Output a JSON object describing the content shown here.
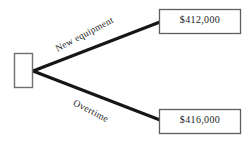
{
  "diagram": {
    "type": "decision-tree",
    "background_color": "#ffffff",
    "line_color": "#161616",
    "box_border_color": "#5d5d5d",
    "text_color": "#1d1d1d",
    "decision_node": {
      "shape": "rectangle",
      "label": ""
    },
    "branches": [
      {
        "id": "upper",
        "label": "New equipment",
        "outcome": "$412,000"
      },
      {
        "id": "lower",
        "label": "Overtime",
        "outcome": "$416,000"
      }
    ],
    "outcomes": {
      "top": "$412,000",
      "bottom": "$416,000"
    }
  }
}
